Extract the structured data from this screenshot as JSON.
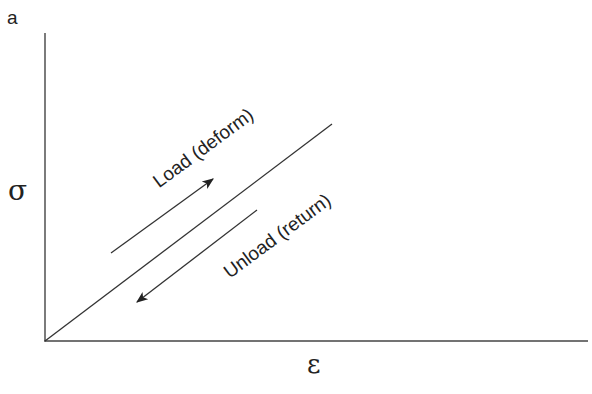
{
  "figure": {
    "panel_label": "a",
    "y_axis_label": "σ",
    "x_axis_label": "ε",
    "load_label": "Load (deform)",
    "unload_label": "Unload (return)",
    "line_color": "#333333",
    "text_color": "#222222"
  }
}
